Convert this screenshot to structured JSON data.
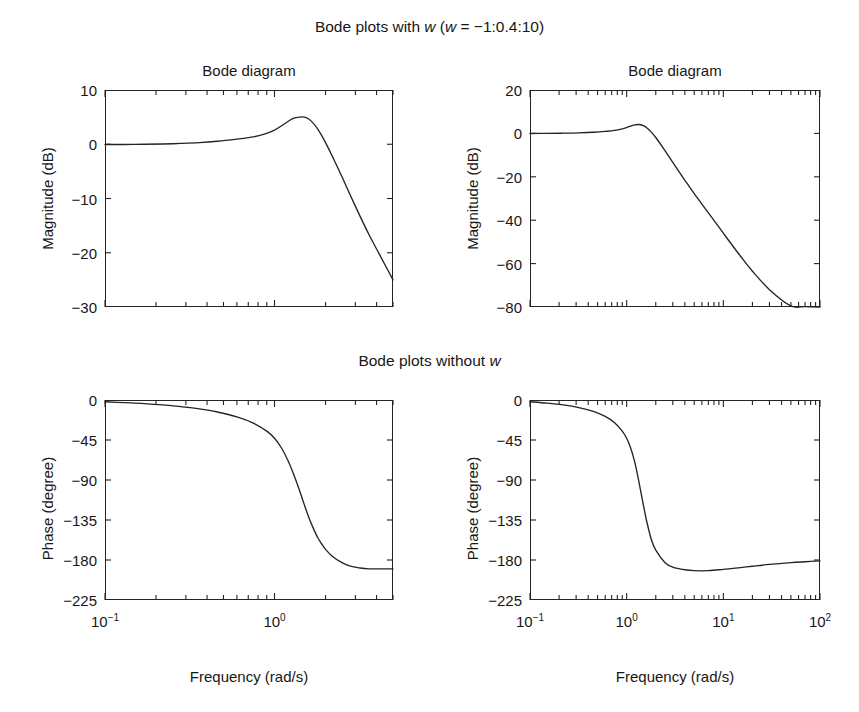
{
  "figure": {
    "suptitle_top_prefix": "Bode plots with ",
    "suptitle_top_var": "w",
    "suptitle_top_suffix": " (",
    "suptitle_top_var2": "w",
    "suptitle_top_expr": " = −1:0.4:10)",
    "midtitle_prefix": "Bode plots without ",
    "midtitle_var": "w",
    "background_color": "#ffffff",
    "line_color": "#242424",
    "text_color": "#171717"
  },
  "chart_data": [
    {
      "id": "top-left",
      "type": "line",
      "title": "Bode diagram",
      "xlabel": "",
      "ylabel": "Magnitude (dB)",
      "xscale": "log",
      "xlim": [
        0.1,
        5.0
      ],
      "ylim": [
        -30,
        10
      ],
      "yticks": [
        10,
        0,
        -10,
        -20,
        -30
      ],
      "ytick_labels": [
        "10",
        "0",
        "−10",
        "−20",
        "−30"
      ],
      "xticks": [
        0.1,
        1.0
      ],
      "xtick_labels": [
        "10−1",
        "10⁰"
      ],
      "grid": false,
      "legend": null,
      "x": [
        0.1,
        0.13,
        0.17,
        0.22,
        0.28,
        0.36,
        0.46,
        0.6,
        0.75,
        0.9,
        1.0,
        1.1,
        1.2,
        1.3,
        1.4,
        1.5,
        1.6,
        1.7,
        1.8,
        1.9,
        2.0,
        2.2,
        2.5,
        2.8,
        3.2,
        3.6,
        4.0,
        4.5,
        5.0
      ],
      "y": [
        -0.05,
        -0.05,
        0.0,
        0.05,
        0.15,
        0.3,
        0.55,
        0.95,
        1.35,
        2.0,
        2.6,
        3.4,
        4.2,
        4.8,
        5.0,
        5.0,
        4.6,
        3.8,
        2.8,
        1.6,
        0.3,
        -2.3,
        -6.0,
        -9.4,
        -13.3,
        -16.6,
        -19.3,
        -22.3,
        -25.0
      ]
    },
    {
      "id": "top-right",
      "type": "line",
      "title": "Bode diagram",
      "xlabel": "",
      "ylabel": "Magnitude (dB)",
      "xscale": "log",
      "xlim": [
        0.1,
        100
      ],
      "ylim": [
        -80,
        20
      ],
      "yticks": [
        20,
        0,
        -20,
        -40,
        -60,
        -80
      ],
      "ytick_labels": [
        "20",
        "0",
        "−20",
        "−40",
        "−60",
        "−80"
      ],
      "xticks": [
        0.1,
        1.0,
        10.0,
        100.0
      ],
      "xtick_labels": [
        "10−1",
        "10⁰",
        "10¹",
        "10²"
      ],
      "grid": false,
      "legend": null,
      "x": [
        0.1,
        0.15,
        0.22,
        0.32,
        0.46,
        0.6,
        0.75,
        0.9,
        1.0,
        1.1,
        1.2,
        1.3,
        1.4,
        1.5,
        1.6,
        1.8,
        2.0,
        2.5,
        3.0,
        4.0,
        5.0,
        7.0,
        10.0,
        15.0,
        20.0,
        30.0,
        50.0,
        70.0,
        100.0
      ],
      "y": [
        -0.05,
        0.0,
        0.1,
        0.25,
        0.55,
        0.95,
        1.4,
        2.1,
        2.7,
        3.4,
        3.9,
        4.1,
        4.0,
        3.5,
        2.7,
        0.6,
        -1.9,
        -8.0,
        -13.4,
        -21.6,
        -27.8,
        -36.6,
        -46.0,
        -56.5,
        -63.5,
        -72.0,
        -79.5,
        -79.8,
        -80.0
      ]
    },
    {
      "id": "bottom-left",
      "type": "line",
      "title": "",
      "xlabel": "Frequency (rad/s)",
      "ylabel": "Phase (degree)",
      "xscale": "log",
      "xlim": [
        0.1,
        5.0
      ],
      "ylim": [
        -225,
        0
      ],
      "yticks": [
        0,
        -45,
        -90,
        -135,
        -180,
        -225
      ],
      "ytick_labels": [
        "0",
        "−45",
        "−90",
        "−135",
        "−180",
        "−225"
      ],
      "xticks": [
        0.1,
        1.0
      ],
      "xtick_labels": [
        "10−1",
        "10⁰"
      ],
      "grid": false,
      "legend": null,
      "x": [
        0.1,
        0.13,
        0.17,
        0.22,
        0.28,
        0.36,
        0.46,
        0.6,
        0.75,
        0.9,
        1.0,
        1.1,
        1.2,
        1.3,
        1.4,
        1.5,
        1.6,
        1.7,
        1.8,
        1.9,
        2.0,
        2.2,
        2.5,
        2.8,
        3.2,
        3.6,
        4.0,
        4.5,
        5.0
      ],
      "y": [
        -2.0,
        -3.0,
        -4.0,
        -5.5,
        -7.5,
        -10.0,
        -13.5,
        -19.0,
        -26.0,
        -35.0,
        -43.0,
        -54.0,
        -68.0,
        -84.0,
        -101.0,
        -118.0,
        -133.0,
        -145.0,
        -155.0,
        -162.0,
        -168.0,
        -176.0,
        -183.0,
        -187.0,
        -189.0,
        -190.0,
        -190.0,
        -190.0,
        -190.0
      ]
    },
    {
      "id": "bottom-right",
      "type": "line",
      "title": "",
      "xlabel": "Frequency (rad/s)",
      "ylabel": "Phase (degree)",
      "xscale": "log",
      "xlim": [
        0.1,
        100
      ],
      "ylim": [
        -225,
        0
      ],
      "yticks": [
        0,
        -45,
        -90,
        -135,
        -180,
        -225
      ],
      "ytick_labels": [
        "0",
        "−45",
        "−90",
        "−135",
        "−180",
        "−225"
      ],
      "xticks": [
        0.1,
        1.0,
        10.0,
        100.0
      ],
      "xtick_labels": [
        "10−1",
        "10⁰",
        "10¹",
        "10²"
      ],
      "grid": false,
      "legend": null,
      "x": [
        0.1,
        0.15,
        0.22,
        0.32,
        0.46,
        0.6,
        0.75,
        0.9,
        1.0,
        1.1,
        1.2,
        1.3,
        1.4,
        1.5,
        1.6,
        1.8,
        2.0,
        2.5,
        3.0,
        4.0,
        5.0,
        7.0,
        10.0,
        15.0,
        20.0,
        30.0,
        50.0,
        70.0,
        100.0
      ],
      "y": [
        -2.0,
        -3.5,
        -5.5,
        -8.5,
        -13.0,
        -18.5,
        -25.5,
        -35.0,
        -43.0,
        -54.0,
        -68.0,
        -85.0,
        -103.0,
        -120.0,
        -135.0,
        -157.0,
        -169.0,
        -183.0,
        -188.0,
        -191.0,
        -192.0,
        -192.0,
        -190.5,
        -188.5,
        -187.0,
        -185.0,
        -183.0,
        -182.0,
        -181.0
      ]
    }
  ]
}
